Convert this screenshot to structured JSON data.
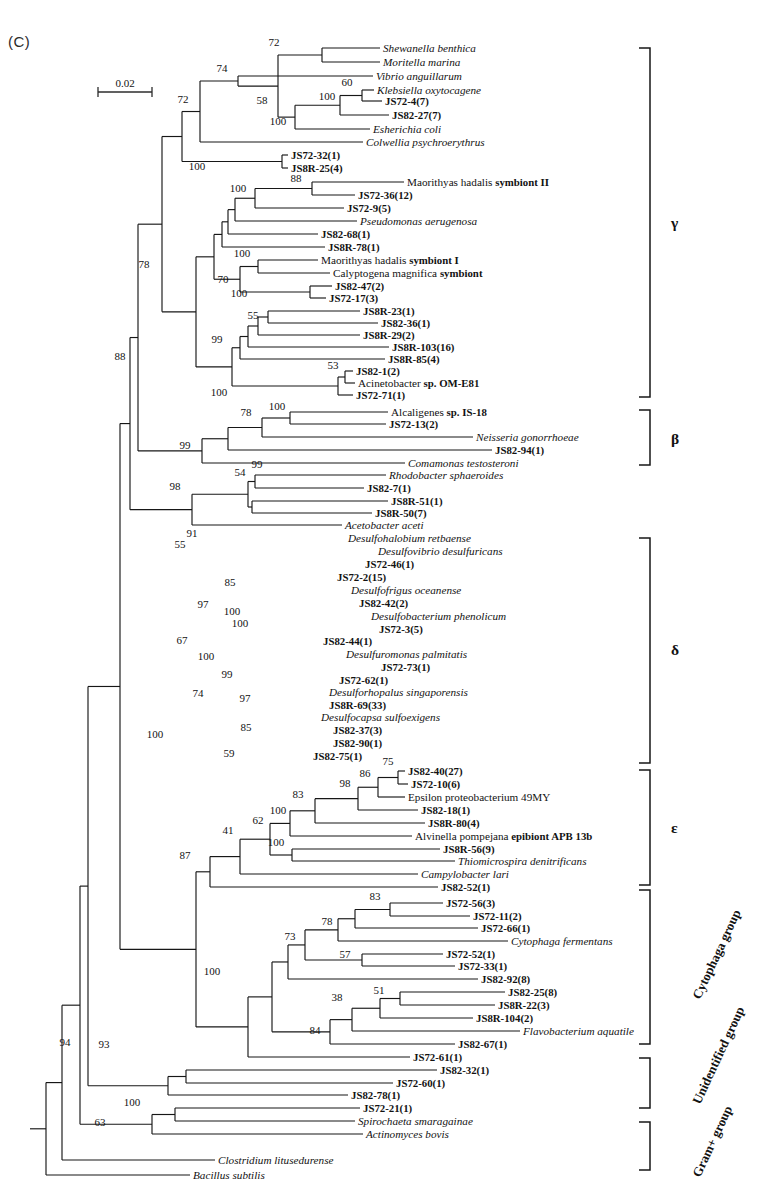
{
  "figure": {
    "panel_label": "(C)",
    "scale_bar": {
      "value": "0.02",
      "x1": 98,
      "x2": 152,
      "y": 92
    },
    "type": "phylogenetic-tree"
  },
  "chart_data": {
    "type": "tree",
    "title": "(C)",
    "scale": "0.02",
    "taxa": [
      {
        "id": "t1",
        "label": "Shewanella benthica",
        "style": "ital",
        "y": 48,
        "x": 380
      },
      {
        "id": "t2",
        "label": "Moritella marina",
        "style": "ital",
        "y": 62,
        "x": 380
      },
      {
        "id": "t3",
        "label": "Vibrio anguillarum",
        "style": "ital",
        "y": 76,
        "x": 373
      },
      {
        "id": "t4",
        "label": "Klebsiella oxytocagene",
        "style": "ital",
        "y": 90,
        "x": 374
      },
      {
        "id": "t5",
        "label": "JS72-4(7)",
        "style": "clone",
        "y": 101,
        "x": 382
      },
      {
        "id": "t6",
        "label": "JS82-27(7)",
        "style": "clone",
        "y": 115,
        "x": 389
      },
      {
        "id": "t7",
        "label": "Esherichia coli",
        "style": "ital",
        "y": 129,
        "x": 370
      },
      {
        "id": "t8",
        "label": "Colwellia psychroerythrus",
        "style": "ital",
        "y": 142,
        "x": 363
      },
      {
        "id": "t9",
        "label": "JS72-32(1)",
        "style": "clone",
        "y": 155,
        "x": 288
      },
      {
        "id": "t10",
        "label": "JS8R-25(4)",
        "style": "clone",
        "y": 168,
        "x": 288
      },
      {
        "id": "t11",
        "label": "Maorithyas hadalis symbiont II",
        "style": "ital-mixed",
        "y": 182,
        "x": 404,
        "ital_until": "Maorithyas hadalis "
      },
      {
        "id": "t12",
        "label": "JS72-36(12)",
        "style": "clone",
        "y": 195,
        "x": 355
      },
      {
        "id": "t13",
        "label": "JS72-9(5)",
        "style": "clone",
        "y": 208,
        "x": 344
      },
      {
        "id": "t14",
        "label": "Pseudomonas aerugenosa",
        "style": "ital",
        "y": 221,
        "x": 357
      },
      {
        "id": "t15",
        "label": "JS82-68(1)",
        "style": "clone",
        "y": 234,
        "x": 318
      },
      {
        "id": "t16",
        "label": "JS8R-78(1)",
        "style": "clone",
        "y": 247,
        "x": 325
      },
      {
        "id": "t17",
        "label": "Maorithyas hadalis symbiont I",
        "style": "ital-mixed",
        "y": 260,
        "x": 318,
        "ital_until": "Maorithyas hadalis "
      },
      {
        "id": "t18",
        "label": "Calyptogena magnifica symbiont",
        "style": "ital-mixed",
        "y": 273,
        "x": 330,
        "ital_until": "Calyptogena magnifica "
      },
      {
        "id": "t19",
        "label": "JS82-47(2)",
        "style": "clone",
        "y": 286,
        "x": 332
      },
      {
        "id": "t20",
        "label": "JS72-17(3)",
        "style": "clone",
        "y": 298,
        "x": 326
      },
      {
        "id": "t21",
        "label": "JS8R-23(1)",
        "style": "clone",
        "y": 311,
        "x": 360
      },
      {
        "id": "t22",
        "label": "JS82-36(1)",
        "style": "clone",
        "y": 323,
        "x": 378
      },
      {
        "id": "t23",
        "label": "JS8R-29(2)",
        "style": "clone",
        "y": 335,
        "x": 360
      },
      {
        "id": "t24",
        "label": "JS8R-103(16)",
        "style": "clone",
        "y": 347,
        "x": 389
      },
      {
        "id": "t25",
        "label": "JS8R-85(4)",
        "style": "clone",
        "y": 359,
        "x": 385
      },
      {
        "id": "t26",
        "label": "JS82-1(2)",
        "style": "clone",
        "y": 371,
        "x": 353
      },
      {
        "id": "t27",
        "label": "Acinetobacter sp. OM-E81",
        "style": "ital-mixed",
        "y": 383,
        "x": 355,
        "ital_until": "Acinetobacter "
      },
      {
        "id": "t28",
        "label": "JS72-71(1)",
        "style": "clone",
        "y": 395,
        "x": 353
      },
      {
        "id": "t29",
        "label": "Alcaligenes sp. IS-18",
        "style": "ital-mixed",
        "y": 412,
        "x": 388,
        "ital_until": "Alcaligenes "
      },
      {
        "id": "t30",
        "label": "JS72-13(2)",
        "style": "clone",
        "y": 424,
        "x": 386
      },
      {
        "id": "t31",
        "label": "Neisseria gonorrhoeae",
        "style": "ital",
        "y": 437,
        "x": 473
      },
      {
        "id": "t32",
        "label": "JS82-94(1)",
        "style": "clone",
        "y": 450,
        "x": 492
      },
      {
        "id": "t33",
        "label": "Comamonas testosteroni",
        "style": "ital",
        "y": 463,
        "x": 405
      },
      {
        "id": "t34",
        "label": "Rhodobacter sphaeroides",
        "style": "ital",
        "y": 475,
        "x": 386
      },
      {
        "id": "t35",
        "label": "JS82-7(1)",
        "style": "clone",
        "y": 488,
        "x": 364
      },
      {
        "id": "t36",
        "label": "JS8R-51(1)",
        "style": "clone",
        "y": 501,
        "x": 388
      },
      {
        "id": "t37",
        "label": "JS8R-50(7)",
        "style": "clone",
        "y": 513,
        "x": 372
      },
      {
        "id": "t38",
        "label": "Acetobacter aceti",
        "style": "ital",
        "y": 525,
        "x": 342
      },
      {
        "id": "t39",
        "label": "Desulfohalobium retbaense",
        "style": "ital",
        "y": 538,
        "x": 345
      },
      {
        "id": "t40",
        "label": "Desulfovibrio desulfuricans",
        "style": "ital",
        "y": 551,
        "x": 375
      },
      {
        "id": "t41",
        "label": "JS72-46(1)",
        "style": "clone",
        "y": 564,
        "x": 362
      },
      {
        "id": "t42",
        "label": "JS72-2(15)",
        "style": "clone",
        "y": 577,
        "x": 334
      },
      {
        "id": "t43",
        "label": "Desulfofrigus oceanense",
        "style": "ital",
        "y": 590,
        "x": 348
      },
      {
        "id": "t44",
        "label": "JS82-42(2)",
        "style": "clone",
        "y": 603,
        "x": 356
      },
      {
        "id": "t45",
        "label": "Desulfobacterium phenolicum",
        "style": "ital",
        "y": 616,
        "x": 368
      },
      {
        "id": "t46",
        "label": "JS72-3(5)",
        "style": "clone",
        "y": 629,
        "x": 376
      },
      {
        "id": "t47",
        "label": "JS82-44(1)",
        "style": "clone",
        "y": 641,
        "x": 320
      },
      {
        "id": "t48",
        "label": "JS72-73(1)",
        "style": "clone",
        "y": 667,
        "x": 378
      },
      {
        "id": "t49",
        "label": "Desulfuromonas palmitatis",
        "style": "ital",
        "y": 654,
        "x": 343
      },
      {
        "id": "t50",
        "label": "JS72-62(1)",
        "style": "clone",
        "y": 680,
        "x": 336
      },
      {
        "id": "t51",
        "label": "Desulforhopalus singaporensis",
        "style": "ital",
        "y": 692,
        "x": 326
      },
      {
        "id": "t52",
        "label": "JS8R-69(33)",
        "style": "clone",
        "y": 705,
        "x": 326
      },
      {
        "id": "t53",
        "label": "Desulfocapsa sulfoexigens",
        "style": "ital",
        "y": 717,
        "x": 318
      },
      {
        "id": "t54",
        "label": "JS82-37(3)",
        "style": "clone",
        "y": 730,
        "x": 330
      },
      {
        "id": "t55",
        "label": "JS82-90(1)",
        "style": "clone",
        "y": 743,
        "x": 330
      },
      {
        "id": "t56",
        "label": "JS82-75(1)",
        "style": "clone",
        "y": 756,
        "x": 310
      },
      {
        "id": "t57",
        "label": "JS82-40(27)",
        "style": "clone",
        "y": 771,
        "x": 405
      },
      {
        "id": "t58",
        "label": "JS72-10(6)",
        "style": "clone",
        "y": 784,
        "x": 408
      },
      {
        "id": "t59",
        "label": "Epsilon proteobacterium 49MY",
        "style": "plain",
        "y": 797,
        "x": 405
      },
      {
        "id": "t60",
        "label": "JS82-18(1)",
        "style": "clone",
        "y": 810,
        "x": 418
      },
      {
        "id": "t61",
        "label": "JS8R-80(4)",
        "style": "clone",
        "y": 823,
        "x": 425
      },
      {
        "id": "t62",
        "label": "Alvinella pompejana epibiont APB 13b",
        "style": "ital-mixed",
        "y": 836,
        "x": 412,
        "ital_until": "Alvinella pompejana "
      },
      {
        "id": "t63",
        "label": "JS8R-56(9)",
        "style": "clone",
        "y": 849,
        "x": 440
      },
      {
        "id": "t64",
        "label": "Thiomicrospira denitrificans",
        "style": "ital",
        "y": 861,
        "x": 455
      },
      {
        "id": "t65",
        "label": "Campylobacter lari",
        "style": "ital",
        "y": 874,
        "x": 418
      },
      {
        "id": "t66",
        "label": "JS82-52(1)",
        "style": "clone",
        "y": 887,
        "x": 438
      },
      {
        "id": "t67",
        "label": "JS72-56(3)",
        "style": "clone",
        "y": 903,
        "x": 443
      },
      {
        "id": "t68",
        "label": "JS72-11(2)",
        "style": "clone",
        "y": 916,
        "x": 470
      },
      {
        "id": "t69",
        "label": "JS72-66(1)",
        "style": "clone",
        "y": 928,
        "x": 478
      },
      {
        "id": "t70",
        "label": "Cytophaga fermentans",
        "style": "ital",
        "y": 941,
        "x": 508
      },
      {
        "id": "t71",
        "label": "JS72-52(1)",
        "style": "clone",
        "y": 954,
        "x": 443
      },
      {
        "id": "t72",
        "label": "JS72-33(1)",
        "style": "clone",
        "y": 966,
        "x": 455
      },
      {
        "id": "t73",
        "label": "JS82-92(8)",
        "style": "clone",
        "y": 979,
        "x": 478
      },
      {
        "id": "t74",
        "label": "JS82-25(8)",
        "style": "clone",
        "y": 992,
        "x": 505
      },
      {
        "id": "t75",
        "label": "JS8R-22(3)",
        "style": "clone",
        "y": 1005,
        "x": 495
      },
      {
        "id": "t76",
        "label": "JS8R-104(2)",
        "style": "clone",
        "y": 1018,
        "x": 473
      },
      {
        "id": "t77",
        "label": "Flavobacterium aquatile",
        "style": "ital",
        "y": 1031,
        "x": 520
      },
      {
        "id": "t78",
        "label": "JS82-67(1)",
        "style": "clone",
        "y": 1044,
        "x": 455
      },
      {
        "id": "t79",
        "label": "JS72-61(1)",
        "style": "clone",
        "y": 1057,
        "x": 410
      },
      {
        "id": "t80",
        "label": "JS82-32(1)",
        "style": "clone",
        "y": 1070,
        "x": 437
      },
      {
        "id": "t81",
        "label": "JS72-60(1)",
        "style": "clone",
        "y": 1083,
        "x": 393
      },
      {
        "id": "t82",
        "label": "JS82-78(1)",
        "style": "clone",
        "y": 1095,
        "x": 348
      },
      {
        "id": "t83",
        "label": "JS72-21(1)",
        "style": "clone",
        "y": 1108,
        "x": 360
      },
      {
        "id": "t84",
        "label": "Spirochaeta smaragainae",
        "style": "ital",
        "y": 1121,
        "x": 355
      },
      {
        "id": "t85",
        "label": "Actinomyces bovis",
        "style": "ital",
        "y": 1134,
        "x": 363
      },
      {
        "id": "t86",
        "label": "Clostridium litusedurense",
        "style": "ital",
        "y": 1160,
        "x": 215
      },
      {
        "id": "t87",
        "label": "Bacillus subtilis",
        "style": "ital",
        "y": 1175,
        "x": 190
      }
    ],
    "bootstrap_values": [
      {
        "value": "72",
        "x": 274,
        "y": 46
      },
      {
        "value": "74",
        "x": 222,
        "y": 72
      },
      {
        "value": "72",
        "x": 183,
        "y": 103
      },
      {
        "value": "58",
        "x": 262,
        "y": 104
      },
      {
        "value": "60",
        "x": 347,
        "y": 86
      },
      {
        "value": "100",
        "x": 327,
        "y": 100
      },
      {
        "value": "100",
        "x": 278,
        "y": 125
      },
      {
        "value": "100",
        "x": 197,
        "y": 170
      },
      {
        "value": "88",
        "x": 296,
        "y": 182
      },
      {
        "value": "100",
        "x": 238,
        "y": 192
      },
      {
        "value": "78",
        "x": 144,
        "y": 268
      },
      {
        "value": "100",
        "x": 242,
        "y": 257
      },
      {
        "value": "70",
        "x": 223,
        "y": 283
      },
      {
        "value": "100",
        "x": 239,
        "y": 297
      },
      {
        "value": "55",
        "x": 253,
        "y": 319
      },
      {
        "value": "99",
        "x": 217,
        "y": 343
      },
      {
        "value": "53",
        "x": 333,
        "y": 369
      },
      {
        "value": "88",
        "x": 120,
        "y": 360
      },
      {
        "value": "100",
        "x": 219,
        "y": 396
      },
      {
        "value": "100",
        "x": 277,
        "y": 410
      },
      {
        "value": "78",
        "x": 246,
        "y": 416
      },
      {
        "value": "99",
        "x": 185,
        "y": 449
      },
      {
        "value": "99",
        "x": 257,
        "y": 468
      },
      {
        "value": "54",
        "x": 240,
        "y": 476
      },
      {
        "value": "98",
        "x": 175,
        "y": 490
      },
      {
        "value": "91",
        "x": 192,
        "y": 537
      },
      {
        "value": "55",
        "x": 180,
        "y": 548
      },
      {
        "value": "85",
        "x": 230,
        "y": 586
      },
      {
        "value": "97",
        "x": 203,
        "y": 608
      },
      {
        "value": "100",
        "x": 240,
        "y": 627
      },
      {
        "value": "100",
        "x": 232,
        "y": 615
      },
      {
        "value": "67",
        "x": 182,
        "y": 644
      },
      {
        "value": "100",
        "x": 206,
        "y": 660
      },
      {
        "value": "99",
        "x": 227,
        "y": 678
      },
      {
        "value": "74",
        "x": 198,
        "y": 697
      },
      {
        "value": "97",
        "x": 245,
        "y": 702
      },
      {
        "value": "85",
        "x": 246,
        "y": 731
      },
      {
        "value": "59",
        "x": 229,
        "y": 757
      },
      {
        "value": "100",
        "x": 155,
        "y": 738
      },
      {
        "value": "75",
        "x": 388,
        "y": 765
      },
      {
        "value": "86",
        "x": 365,
        "y": 777
      },
      {
        "value": "98",
        "x": 345,
        "y": 787
      },
      {
        "value": "83",
        "x": 298,
        "y": 798
      },
      {
        "value": "100",
        "x": 278,
        "y": 814
      },
      {
        "value": "62",
        "x": 258,
        "y": 824
      },
      {
        "value": "41",
        "x": 228,
        "y": 834
      },
      {
        "value": "100",
        "x": 276,
        "y": 846
      },
      {
        "value": "87",
        "x": 185,
        "y": 859
      },
      {
        "value": "83",
        "x": 375,
        "y": 900
      },
      {
        "value": "78",
        "x": 327,
        "y": 925
      },
      {
        "value": "73",
        "x": 290,
        "y": 940
      },
      {
        "value": "57",
        "x": 345,
        "y": 958
      },
      {
        "value": "38",
        "x": 337,
        "y": 1001
      },
      {
        "value": "51",
        "x": 379,
        "y": 994
      },
      {
        "value": "84",
        "x": 315,
        "y": 1034
      },
      {
        "value": "100",
        "x": 212,
        "y": 975
      },
      {
        "value": "93",
        "x": 104,
        "y": 1048
      },
      {
        "value": "94",
        "x": 65,
        "y": 1046
      },
      {
        "value": "100",
        "x": 132,
        "y": 1106
      },
      {
        "value": "63",
        "x": 100,
        "y": 1126
      }
    ],
    "group_brackets": [
      {
        "label": "γ",
        "y1": 48,
        "y2": 397,
        "x": 650,
        "label_x": 671,
        "label_y": 228,
        "rotated": false
      },
      {
        "label": "β",
        "y1": 410,
        "y2": 465,
        "x": 650,
        "label_x": 671,
        "label_y": 444,
        "rotated": false
      },
      {
        "label": "δ",
        "y1": 538,
        "y2": 763,
        "x": 650,
        "label_x": 671,
        "label_y": 655,
        "rotated": false
      },
      {
        "label": "ε",
        "y1": 770,
        "y2": 885,
        "x": 650,
        "label_x": 671,
        "label_y": 833,
        "rotated": false
      },
      {
        "label": "Cytophaga group",
        "y1": 890,
        "y2": 1044,
        "x": 650,
        "label_x": 700,
        "label_y": 1000,
        "rotated": true
      },
      {
        "label": "Unidentified group",
        "y1": 1058,
        "y2": 1108,
        "x": 650,
        "label_x": 700,
        "label_y": 1105,
        "rotated": true
      },
      {
        "label": "Gram+ group",
        "y1": 1122,
        "y2": 1170,
        "x": 650,
        "label_x": 700,
        "label_y": 1178,
        "rotated": true
      }
    ]
  }
}
